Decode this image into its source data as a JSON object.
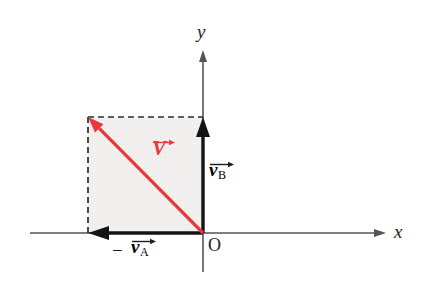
{
  "figure": {
    "background": "#ffffff",
    "width": 422,
    "height": 300
  },
  "colors": {
    "axis": "#555555",
    "vector_black": "#141414",
    "vector_red": "#e8383d",
    "dashed": "#2b2b2b",
    "shade_fill": "#f3f1ef",
    "text": "#1c1c1c"
  },
  "axes": {
    "x_label": "x",
    "y_label": "y",
    "origin_label": "O",
    "x_line": {
      "x1": 30,
      "y1": 233,
      "x2": 386,
      "y2": 233
    },
    "y_line": {
      "x1": 203,
      "y1": 50,
      "x2": 203,
      "y2": 272
    }
  },
  "shaded_rect": {
    "x": 88,
    "y": 117,
    "width": 115,
    "height": 116,
    "fill": "#f3f1ef"
  },
  "dashed_lines": [
    {
      "name": "top-dashed",
      "x1": 88,
      "y1": 117,
      "x2": 203,
      "y2": 117
    },
    {
      "name": "left-dashed",
      "x1": 88,
      "y1": 117,
      "x2": 88,
      "y2": 233
    }
  ],
  "vectors": [
    {
      "id": "v-b",
      "label_text": "v",
      "label_sub": "B",
      "label_prefix": "",
      "color": "#141414",
      "tail": {
        "x": 203,
        "y": 233
      },
      "head": {
        "x": 203,
        "y": 117
      },
      "label_pos": {
        "x": 209,
        "y": 163
      }
    },
    {
      "id": "minus-v-a",
      "label_text": "v",
      "label_sub": "A",
      "label_prefix": "−",
      "color": "#141414",
      "tail": {
        "x": 203,
        "y": 233
      },
      "head": {
        "x": 88,
        "y": 233
      },
      "label_pos": {
        "x": 128,
        "y": 243
      }
    },
    {
      "id": "resultant-v",
      "label_text": "V",
      "label_sub": "",
      "label_prefix": "",
      "color": "#e8383d",
      "tail": {
        "x": 203,
        "y": 233
      },
      "head": {
        "x": 88,
        "y": 117
      },
      "label_pos": {
        "x": 151,
        "y": 141
      }
    }
  ],
  "labels": {
    "x_axis": "x",
    "y_axis": "y",
    "origin": "O",
    "vb_symbol": "v",
    "vb_subscript": "B",
    "va_symbol": "v",
    "va_subscript": "A",
    "va_minus": "−",
    "v_symbol": "V"
  }
}
